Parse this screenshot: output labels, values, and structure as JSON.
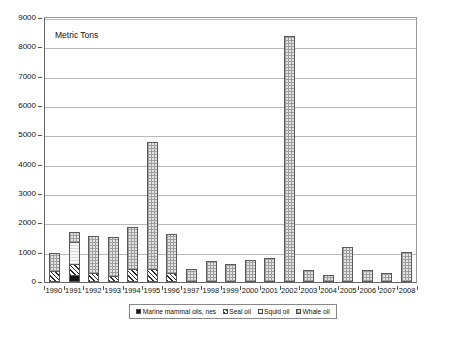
{
  "chart_data": {
    "type": "bar",
    "stacked": true,
    "title": "",
    "axis_note": "Metric Tons",
    "xlabel": "",
    "ylabel": "Metric Tons",
    "ylim": [
      0,
      9000
    ],
    "ytick_step": 1000,
    "grid": true,
    "legend_position": "bottom",
    "categories": [
      "1990",
      "1991",
      "1992",
      "1993",
      "1994",
      "1995",
      "1996",
      "1997",
      "1998",
      "1999",
      "2000",
      "2001",
      "2002",
      "2003",
      "2004",
      "2005",
      "2006",
      "2007",
      "2008"
    ],
    "yticks": [
      "0",
      "1000",
      "2000",
      "3000",
      "4000",
      "5000",
      "6000",
      "7000",
      "8000",
      "9000"
    ],
    "series": [
      {
        "name": "Marine mammal oils, nes",
        "pattern": "solid-black",
        "color": "#151515",
        "values": [
          0,
          250,
          0,
          0,
          0,
          0,
          0,
          0,
          0,
          0,
          0,
          0,
          0,
          0,
          0,
          0,
          0,
          0,
          0
        ]
      },
      {
        "name": "Seal oil",
        "pattern": "diagonal-hatch",
        "color": "#2b2b2b",
        "values": [
          390,
          380,
          300,
          220,
          460,
          450,
          300,
          0,
          0,
          0,
          0,
          0,
          0,
          0,
          0,
          0,
          0,
          0,
          0
        ]
      },
      {
        "name": "Squid oil",
        "pattern": "light-fill",
        "color": "#f2f2f2",
        "values": [
          0,
          740,
          0,
          0,
          0,
          0,
          0,
          0,
          0,
          0,
          0,
          0,
          0,
          0,
          0,
          0,
          0,
          0,
          0
        ]
      },
      {
        "name": "Whale oil",
        "pattern": "gray-checker",
        "color": "#e3e3e3",
        "values": [
          590,
          320,
          1280,
          1300,
          1420,
          4330,
          1320,
          450,
          730,
          630,
          760,
          820,
          8400,
          420,
          240,
          1200,
          400,
          310,
          1030
        ]
      }
    ],
    "totals": [
      980,
      1690,
      1580,
      1520,
      1880,
      4780,
      1620,
      450,
      730,
      630,
      760,
      820,
      8400,
      420,
      240,
      1200,
      400,
      310,
      1030
    ],
    "caption": ""
  },
  "legend": {
    "items": [
      {
        "label": "Marine mammal oils, nes",
        "swatch": "marine"
      },
      {
        "label": "Seal oil",
        "swatch": "seal"
      },
      {
        "label": "Squid oil",
        "swatch": "squid"
      },
      {
        "label": "Whale oil",
        "swatch": "whale"
      }
    ]
  }
}
